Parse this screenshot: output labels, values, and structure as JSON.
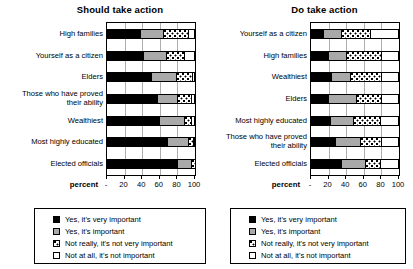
{
  "chart_data": [
    {
      "type": "bar",
      "orientation": "horizontal",
      "stacked": true,
      "title": "Should take action",
      "xlabel": "percent",
      "ylabel": "",
      "xlim": [
        0,
        100
      ],
      "xticks": [
        0,
        20,
        40,
        60,
        80,
        100
      ],
      "xticklabels": [
        "-",
        "20",
        "40",
        "60",
        "80",
        "100"
      ],
      "grid": true,
      "legend_position": "below",
      "categories": [
        "High families",
        "Yourself as a citizen",
        "Elders",
        "Those who have proved\ntheir ability",
        "Wealthiest",
        "Most highly educated",
        "Elected officials"
      ],
      "series": [
        {
          "name": "Yes, it's very important",
          "values": [
            37,
            41,
            50,
            57,
            59,
            69,
            80
          ]
        },
        {
          "name": "Yes, it's important",
          "values": [
            27,
            26,
            28,
            23,
            28,
            24,
            16
          ]
        },
        {
          "name": "Not really, it's not very important",
          "values": [
            28,
            20,
            19,
            15,
            9,
            6,
            4
          ]
        },
        {
          "name": "Not at all, it's not important",
          "values": [
            8,
            13,
            3,
            5,
            4,
            1,
            0
          ]
        }
      ]
    },
    {
      "type": "bar",
      "orientation": "horizontal",
      "stacked": true,
      "title": "Do take action",
      "xlabel": "percent",
      "ylabel": "",
      "xlim": [
        0,
        100
      ],
      "xticks": [
        0,
        20,
        40,
        60,
        80,
        100
      ],
      "xticklabels": [
        "-",
        "20",
        "40",
        "60",
        "80",
        "100"
      ],
      "grid": true,
      "legend_position": "below",
      "categories": [
        "Yourself as a citizen",
        "High families",
        "Wealthiest",
        "Elders",
        "Most highly educated",
        "Those who have proved\ntheir ability",
        "Elected officials"
      ],
      "series": [
        {
          "name": "Yes, it's very important",
          "values": [
            14,
            19,
            23,
            19,
            22,
            27,
            34
          ]
        },
        {
          "name": "Yes, it's important",
          "values": [
            20,
            21,
            21,
            32,
            26,
            29,
            27
          ]
        },
        {
          "name": "Not really, it's not very important",
          "values": [
            33,
            40,
            36,
            29,
            30,
            24,
            18
          ]
        },
        {
          "name": "Not at all, it's not important",
          "values": [
            33,
            20,
            20,
            20,
            22,
            20,
            21
          ]
        }
      ]
    }
  ],
  "legend": {
    "items": [
      {
        "label": "Yes, it's very important",
        "swatch": "solid-black",
        "color": "#000000"
      },
      {
        "label": "Yes, it's important",
        "swatch": "solid-gray",
        "color": "#a9a9a9"
      },
      {
        "label": "Not really, it's not very important",
        "swatch": "dotted-hatch",
        "color": "#ffffff"
      },
      {
        "label": "Not at all, it's not important",
        "swatch": "empty-white",
        "color": "#ffffff"
      }
    ]
  }
}
